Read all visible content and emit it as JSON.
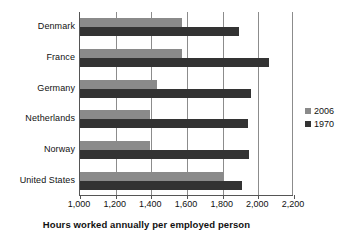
{
  "chart_data": {
    "type": "bar",
    "orientation": "horizontal",
    "title": "",
    "xlabel": "Hours worked annually per employed person",
    "ylabel": "",
    "xlim": [
      1000,
      2200
    ],
    "xticks": [
      "1,000",
      "1,200",
      "1,400",
      "1,600",
      "1,800",
      "2,000",
      "2,200"
    ],
    "xtick_values": [
      1000,
      1200,
      1400,
      1600,
      1800,
      2000,
      2200
    ],
    "grid": true,
    "legend_position": "right",
    "categories": [
      "Denmark",
      "France",
      "Germany",
      "Netherlands",
      "Norway",
      "United States"
    ],
    "series": [
      {
        "name": "2006",
        "color": "#8a8a8a",
        "values": [
          1570,
          1570,
          1430,
          1390,
          1390,
          1800
        ]
      },
      {
        "name": "1970",
        "color": "#333333",
        "values": [
          1890,
          2060,
          1960,
          1940,
          1950,
          1910
        ]
      }
    ]
  },
  "legend": {
    "items": [
      {
        "label": "2006",
        "color": "#8a8a8a"
      },
      {
        "label": "1970",
        "color": "#333333"
      }
    ]
  }
}
